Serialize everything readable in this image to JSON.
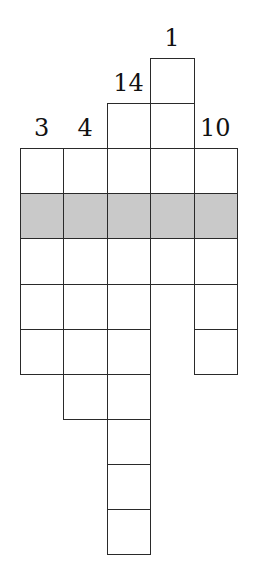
{
  "puzzle": {
    "type": "column-number-grid",
    "shaded_row_color": "#c9c9c9",
    "columns": [
      {
        "label": "3",
        "top_row": 2,
        "cell_count": 5
      },
      {
        "label": "4",
        "top_row": 2,
        "cell_count": 6
      },
      {
        "label": "14",
        "top_row": 1,
        "cell_count": 10
      },
      {
        "label": "1",
        "top_row": 0,
        "cell_count": 5
      },
      {
        "label": "10",
        "top_row": 2,
        "cell_count": 5
      }
    ],
    "shaded_row_index": 3
  }
}
